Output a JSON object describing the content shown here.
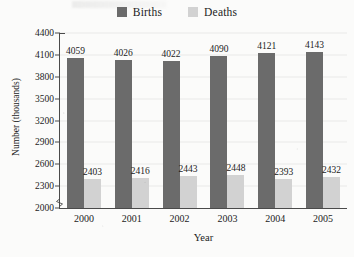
{
  "legend": {
    "position": "top-center",
    "entries": [
      {
        "label": "Births",
        "color": "#6b6b6b",
        "icon": "legend-swatch-icon"
      },
      {
        "label": "Deaths",
        "color": "#d2d2d2",
        "icon": "legend-swatch-icon"
      }
    ]
  },
  "axes": {
    "y_title": "Number (thousands)",
    "x_title": "Year",
    "y_ticks": [
      "2000",
      "2300",
      "2600",
      "2900",
      "3200",
      "3500",
      "3800",
      "4100",
      "4400"
    ],
    "x_ticks": [
      "2000",
      "2001",
      "2002",
      "2003",
      "2004",
      "2005"
    ],
    "axis_break_symbol": "zigzag-break-icon"
  },
  "chart_data": {
    "type": "bar",
    "title": "",
    "xlabel": "Year",
    "ylabel": "Number (thousands)",
    "categories": [
      "2000",
      "2001",
      "2002",
      "2003",
      "2004",
      "2005"
    ],
    "series": [
      {
        "name": "Births",
        "color": "#6b6b6b",
        "values": [
          4059,
          4026,
          4022,
          4090,
          4121,
          4143
        ]
      },
      {
        "name": "Deaths",
        "color": "#d2d2d2",
        "values": [
          2403,
          2416,
          2443,
          2448,
          2393,
          2432
        ]
      }
    ],
    "ylim": [
      2000,
      4400
    ],
    "ytick_step": 300,
    "grid": "faint-horizontal",
    "legend_position": "top-center",
    "axis_break": true
  }
}
